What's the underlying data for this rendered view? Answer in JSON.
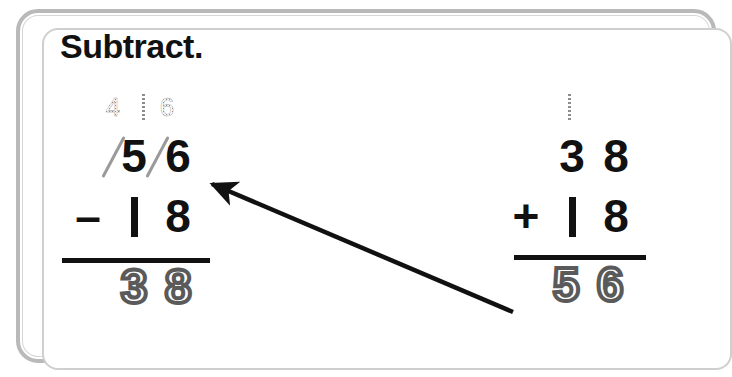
{
  "card": {
    "instruction": "Subtract.",
    "frame_color": "#b9b9b9",
    "background_color": "#ffffff",
    "ink_color": "#111111",
    "traced_color": "#5a5a5a",
    "regroup_color": "#8d8d8d"
  },
  "problems": [
    {
      "id": "subtraction",
      "operation": "subtract",
      "operator_symbol": "–",
      "regroup_marks": {
        "tens": "4",
        "ones_carry": "1",
        "ones": "6",
        "combined_label": "4 16"
      },
      "minuend": {
        "tens": "5",
        "ones": "6",
        "value": "56",
        "crossed_out": "true"
      },
      "subtrahend": {
        "tens": "1",
        "ones": "8",
        "value": "18"
      },
      "answer": {
        "tens": "3",
        "ones": "8",
        "value": "38",
        "style": "traced"
      }
    },
    {
      "id": "addition-check",
      "operation": "add",
      "operator_symbol": "+",
      "carry_mark": {
        "tens": "1"
      },
      "addend_top": {
        "tens": "3",
        "ones": "8",
        "value": "38"
      },
      "addend_bottom": {
        "tens": "1",
        "ones": "8",
        "value": "18"
      },
      "answer": {
        "tens": "5",
        "ones": "6",
        "value": "56",
        "style": "traced"
      }
    }
  ],
  "annotation": {
    "arrow": {
      "name": "check-answer-arrow",
      "from_x": 513,
      "from_y": 312,
      "to_x": 212,
      "to_y": 184,
      "color": "#111111"
    }
  }
}
